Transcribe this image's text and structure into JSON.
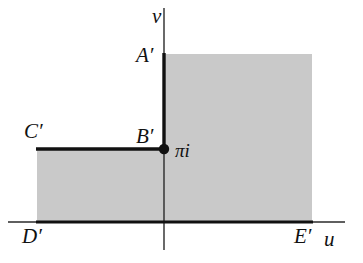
{
  "figure": {
    "width": 363,
    "height": 263,
    "background_color": "#ffffff",
    "shaded_region_color": "#c9c9c9",
    "line_color": "#111111"
  },
  "axes": {
    "vertical_axis_label": "v",
    "horizontal_axis_label": "u",
    "origin_x": 164,
    "origin_y": 222,
    "vertical_axis": {
      "x": 164,
      "y_top": 8,
      "y_bottom": 250
    },
    "horizontal_axis": {
      "y": 222,
      "x_left": 8,
      "x_right": 345
    }
  },
  "labels": [
    {
      "id": "v-axis",
      "text": "v",
      "x": 152,
      "y": 6
    },
    {
      "id": "A-prime",
      "text": "A′",
      "x": 136,
      "y": 45
    },
    {
      "id": "B-prime",
      "text": "B′",
      "x": 136,
      "y": 126
    },
    {
      "id": "C-prime",
      "text": "C′",
      "x": 24,
      "y": 121
    },
    {
      "id": "pi-i",
      "text": "πi",
      "x": 175,
      "y": 141
    },
    {
      "id": "D-prime",
      "text": "D′",
      "x": 22,
      "y": 226
    },
    {
      "id": "E-prime",
      "text": "E′",
      "x": 294,
      "y": 226
    },
    {
      "id": "u-axis",
      "text": "u",
      "x": 324,
      "y": 229
    }
  ],
  "marked_point": {
    "name": "pi-i-point",
    "label": "πi",
    "x": 164,
    "y": 149,
    "radius": 5
  },
  "shaded_region": {
    "description": "L-shaped shaded region: upper strip right of the v-axis above B', plus lower block from C' left edge to E' right edge down to the u-axis",
    "fill": "#c9c9c9",
    "upper_block": {
      "x": 164,
      "y": 54,
      "width": 148,
      "height": 95
    },
    "lower_block": {
      "x": 37,
      "y": 149,
      "width": 275,
      "height": 73
    }
  },
  "boundary_segments": [
    {
      "id": "segment-A-prime-B-prime",
      "from": [
        164,
        54
      ],
      "to": [
        164,
        149
      ],
      "thickness": 3,
      "orientation": "vertical"
    },
    {
      "id": "segment-C-prime-B-prime",
      "from": [
        37,
        149
      ],
      "to": [
        164,
        149
      ],
      "thickness": 3,
      "orientation": "horizontal"
    },
    {
      "id": "segment-D-prime-E-prime",
      "from": [
        37,
        222
      ],
      "to": [
        312,
        222
      ],
      "thickness": 3,
      "orientation": "horizontal"
    }
  ]
}
